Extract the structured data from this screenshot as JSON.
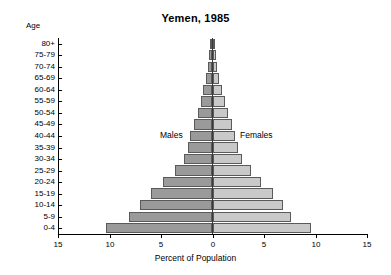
{
  "chart_data": {
    "type": "bar",
    "subtype": "population-pyramid",
    "title": "Yemen, 1985",
    "xlabel": "Percent of Population",
    "ylabel": "Age",
    "xlim": [
      -15,
      15
    ],
    "xticks": [
      15,
      10,
      5,
      0,
      5,
      10,
      15
    ],
    "grid": false,
    "legend_position": "inside-plot",
    "categories": [
      "80+",
      "75-79",
      "70-74",
      "65-69",
      "60-64",
      "55-59",
      "50-54",
      "45-49",
      "40-44",
      "35-39",
      "30-34",
      "25-29",
      "20-24",
      "15-19",
      "10-14",
      "5-9",
      "0-4"
    ],
    "series": [
      {
        "name": "Males",
        "color": "#9a9a9a",
        "values": [
          0.2,
          0.3,
          0.45,
          0.65,
          0.9,
          1.15,
          1.45,
          1.8,
          2.15,
          2.4,
          2.8,
          3.6,
          4.8,
          6.0,
          7.0,
          8.1,
          10.3
        ]
      },
      {
        "name": "Females",
        "color": "#c9c9c9",
        "values": [
          0.2,
          0.3,
          0.45,
          0.65,
          0.9,
          1.2,
          1.5,
          1.85,
          2.2,
          2.5,
          2.9,
          3.7,
          4.7,
          5.9,
          6.8,
          7.6,
          9.6
        ]
      }
    ],
    "annotations": [
      {
        "text": "Males",
        "side": "left"
      },
      {
        "text": "Females",
        "side": "right"
      }
    ]
  },
  "chart": {
    "title": "Yemen, 1985",
    "age_axis_label": "Age",
    "x_axis_title": "Percent of Population",
    "males_label": "Males",
    "females_label": "Females",
    "age_groups": [
      "80+",
      "75-79",
      "70-74",
      "65-69",
      "60-64",
      "55-59",
      "50-54",
      "45-49",
      "40-44",
      "35-39",
      "30-34",
      "25-29",
      "20-24",
      "15-19",
      "10-14",
      "5-9",
      "0-4"
    ],
    "x_tick_labels": [
      "15",
      "10",
      "5",
      "0",
      "5",
      "10",
      "15"
    ],
    "male_color": "#9a9a9a",
    "female_color": "#c9c9c9"
  }
}
